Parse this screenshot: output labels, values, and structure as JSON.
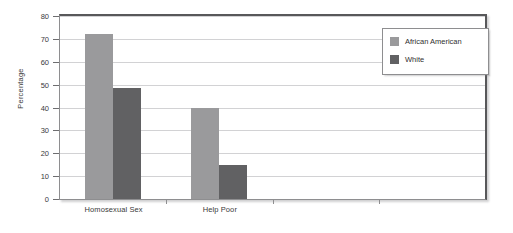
{
  "chart_data": {
    "type": "bar",
    "title": "",
    "xlabel": "",
    "ylabel": "Percentage",
    "ylim": [
      0,
      80
    ],
    "yticks": [
      0,
      10,
      20,
      30,
      40,
      50,
      60,
      70,
      80
    ],
    "grid": true,
    "legend_position": "top-right",
    "categories": [
      "Homosexual Sex",
      "Help Poor"
    ],
    "series": [
      {
        "name": "African American",
        "color": "#9a9a9c",
        "values": [
          72,
          40
        ]
      },
      {
        "name": "White",
        "color": "#616163",
        "values": [
          48.5,
          15
        ]
      }
    ]
  },
  "axis": {
    "y_title": "Percentage",
    "y_tick_labels": [
      "80",
      "70",
      "60",
      "50",
      "40",
      "30",
      "20",
      "10",
      "0"
    ],
    "x_tick_labels": [
      "Homosexual Sex",
      "Help Poor"
    ]
  },
  "legend": {
    "entries": [
      {
        "label": "African American",
        "color": "#9a9a9c"
      },
      {
        "label": "White",
        "color": "#616163"
      }
    ]
  },
  "colors": {
    "series_light": "#9a9a9c",
    "series_dark": "#616163",
    "gridline": "#d2d2d4",
    "frame": "#58585a",
    "text": "#3a3a3a",
    "background": "#ffffff"
  }
}
